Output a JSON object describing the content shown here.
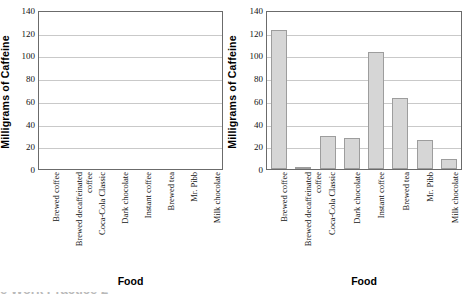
{
  "chart_data": [
    {
      "type": "bar",
      "panel": "left",
      "title": "",
      "xlabel": "Food",
      "ylabel": "Milligrams of Caffeine",
      "ylim": [
        0,
        140
      ],
      "yticks": [
        0,
        20,
        40,
        60,
        80,
        100,
        120,
        140
      ],
      "grid": true,
      "legend": "none",
      "categories": [
        "Brewed coffee",
        "Brewed decaffeinated coffee",
        "Coca-Cola Classic",
        "Dark chocolate",
        "Instant coffee",
        "Brewed tea",
        "Mr. Pibb",
        "Milk chocolate"
      ],
      "values": [
        null,
        null,
        null,
        null,
        null,
        null,
        null,
        null
      ],
      "note": "empty plot - axes and gridlines only, no bars drawn"
    },
    {
      "type": "bar",
      "panel": "right",
      "title": "",
      "xlabel": "Food",
      "ylabel": "Milligrams of Caffeine",
      "ylim": [
        0,
        140
      ],
      "yticks": [
        0,
        20,
        40,
        60,
        80,
        100,
        120,
        140
      ],
      "grid": true,
      "legend": "none",
      "bar_color": "#d6d6d6",
      "bar_edge_color": "#9d9d9d",
      "categories": [
        "Brewed coffee",
        "Brewed decaffeinated coffee",
        "Coca-Cola Classic",
        "Dark chocolate",
        "Instant coffee",
        "Brewed tea",
        "Mr. Pibb",
        "Milk chocolate"
      ],
      "values": [
        124,
        2,
        29,
        28,
        104,
        63,
        26,
        9
      ]
    }
  ],
  "caption": {
    "cropped_text": "e Work Practice 2"
  }
}
